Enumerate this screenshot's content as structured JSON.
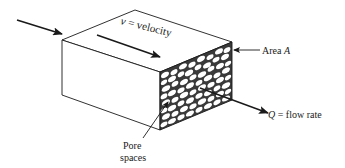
{
  "diagram": {
    "labels": {
      "velocity_symbol": "v",
      "velocity_text": " = velocity",
      "area_text": "Area ",
      "area_symbol": "A",
      "flow_symbol": "Q",
      "flow_text": " = flow rate",
      "pore_line1": "Pore",
      "pore_line2": "spaces"
    },
    "colors": {
      "stroke": "#1a1a1a",
      "pore_face": "#3a3a3a",
      "pore_hole": "#ffffff",
      "background": "#ffffff"
    }
  }
}
